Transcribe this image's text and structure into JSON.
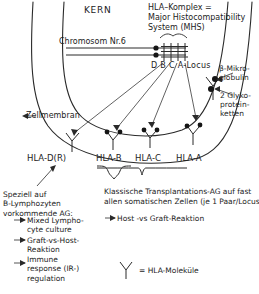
{
  "diagram": {
    "nucleus_label": "KERN",
    "mhc_title": "HLA–Komplex =\nMajor Histocompatibility\nSystem (MHS)",
    "chromosome_label": "Chromosom Nr.6",
    "locus_label": "D B C A-Locus",
    "cell_membrane_label": "Zellmembran",
    "beta2_microglobulin_label": "β-Mikro-\nglobulin",
    "glycoprotein_label": "2 Glyko-\nprotein-\nketten",
    "molecule_labels": {
      "hla_dr": "HLA-D(R)",
      "hla_b": "HLA-B",
      "hla_c": "HLA-C",
      "hla_a": "HLA-A"
    },
    "left_note": {
      "title": "Speziell auf\nB-Lymphozyten\nvorkommende AG:",
      "items": [
        "Mixed Lympho-\ncyte culture",
        "Graft-vs-Host-\nReaktion",
        "Immune\nresponse (IR-)\nregulation"
      ]
    },
    "right_note": {
      "title": "Klassische Transplantations-AG auf fast\nallen somatischen Zellen (je 1 Paar/Locus):",
      "items": [
        "Host -vs Graft-Reaktion"
      ]
    },
    "legend": {
      "symbol_name": "hla-molecule-icon",
      "text": "= HLA-Moleküle"
    },
    "colors": {
      "ink": "#1c1c1c",
      "background": "#ffffff"
    }
  }
}
